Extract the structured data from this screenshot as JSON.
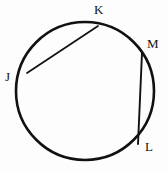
{
  "figure": {
    "background_color": "#fdfdfd",
    "stroke_color": "#111111",
    "label_color": "#121212"
  },
  "chart_data": {
    "type": "diagram",
    "subtype": "euclidean-circle-with-chords",
    "xlabel": "",
    "ylabel": "",
    "xlim": [
      0,
      167
    ],
    "ylim": [
      0,
      171
    ],
    "grid": false,
    "legend": null,
    "circle": {
      "name": "circle",
      "center_x": 85,
      "center_y": 91,
      "radius": 69,
      "stroke_width": 2.6,
      "fill": "none"
    },
    "points": [
      {
        "label": "J",
        "x": 26,
        "y": 127,
        "on_circle": true,
        "label_x": 5,
        "label_y": 70
      },
      {
        "label": "K",
        "x": 99,
        "y": 147,
        "on_circle": true,
        "label_x": 94,
        "label_y": 3
      },
      {
        "label": "M",
        "x": 142,
        "y": 119,
        "on_circle": true,
        "label_x": 147,
        "label_y": 37
      },
      {
        "label": "L",
        "x": 139,
        "y": 28,
        "on_circle": true,
        "label_x": 145,
        "label_y": 140
      }
    ],
    "chords": [
      {
        "name": "chord-JK",
        "from": "J",
        "to": "K",
        "x1": 27,
        "y1": 73,
        "x2": 98,
        "y2": 26,
        "stroke_width": 1.7
      },
      {
        "name": "chord-ML",
        "from": "M",
        "to": "L",
        "x1": 142,
        "y1": 53,
        "x2": 138,
        "y2": 144,
        "stroke_width": 1.9
      }
    ],
    "labels": [
      "J",
      "K",
      "M",
      "L"
    ]
  }
}
